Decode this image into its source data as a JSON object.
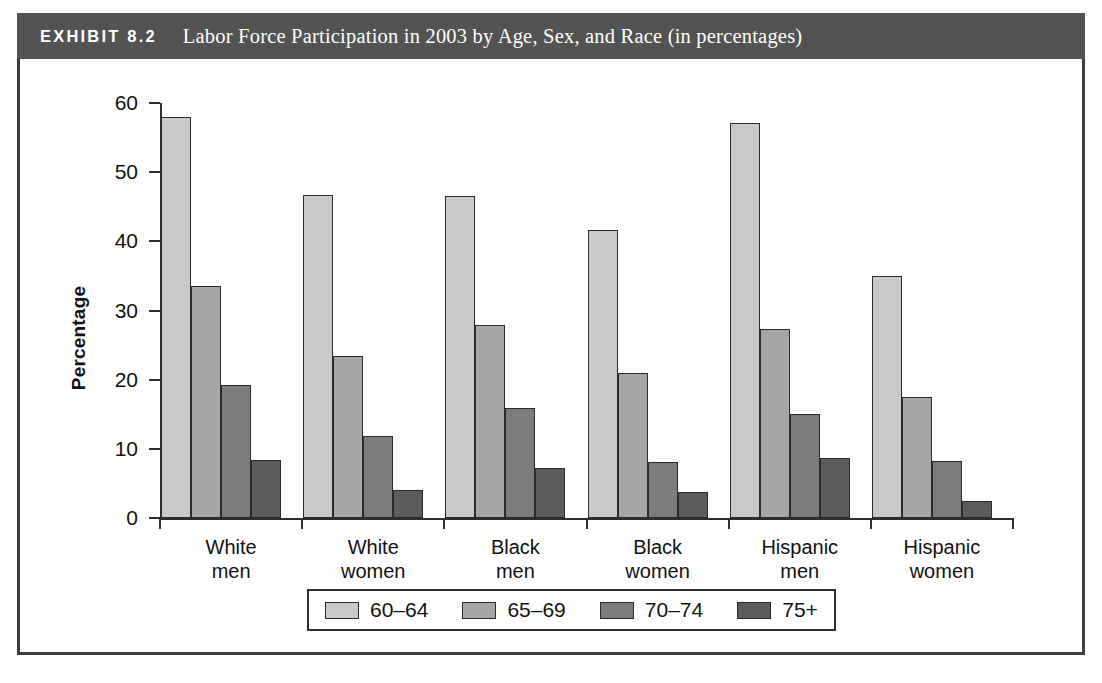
{
  "exhibit": {
    "label": "EXHIBIT 8.2",
    "title": "Labor Force Participation in 2003 by Age, Sex, and Race (in percentages)",
    "header_bg": "#535353",
    "frame_color": "#3d3d3d"
  },
  "chart_data": {
    "type": "bar",
    "title": "Labor Force Participation in 2003 by Age, Sex, and Race (in percentages)",
    "xlabel": "",
    "ylabel": "Percentage",
    "ylim": [
      0,
      60
    ],
    "yticks": [
      0,
      10,
      20,
      30,
      40,
      50,
      60
    ],
    "grid": false,
    "legend_position": "bottom",
    "categories": [
      "White men",
      "White women",
      "Black men",
      "Black women",
      "Hispanic men",
      "Hispanic women"
    ],
    "category_lines": [
      [
        "White",
        "men"
      ],
      [
        "White",
        "women"
      ],
      [
        "Black",
        "men"
      ],
      [
        "Black",
        "women"
      ],
      [
        "Hispanic",
        "men"
      ],
      [
        "Hispanic",
        "women"
      ]
    ],
    "series": [
      {
        "name": "60–64",
        "color": "#c9c9c9",
        "values": [
          58.0,
          46.7,
          46.6,
          41.6,
          57.1,
          35.0
        ]
      },
      {
        "name": "65–69",
        "color": "#a6a6a6",
        "values": [
          33.5,
          23.4,
          27.9,
          21.0,
          27.3,
          17.5
        ]
      },
      {
        "name": "70–74",
        "color": "#7c7c7c",
        "values": [
          19.3,
          11.9,
          15.9,
          8.1,
          15.0,
          8.2
        ]
      },
      {
        "name": "75+",
        "color": "#5c5c5c",
        "values": [
          8.4,
          4.0,
          7.2,
          3.8,
          8.7,
          2.4
        ]
      }
    ]
  }
}
